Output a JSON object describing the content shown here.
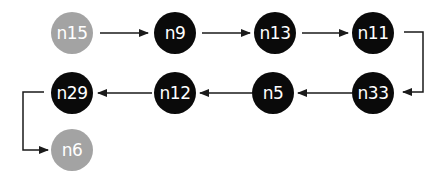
{
  "diagram": {
    "nodes": [
      {
        "id": "n15",
        "label": "n15",
        "style": "grey",
        "x": 72,
        "y": 33
      },
      {
        "id": "n9",
        "label": "n9",
        "style": "dark",
        "x": 175,
        "y": 33
      },
      {
        "id": "n13",
        "label": "n13",
        "style": "dark",
        "x": 275,
        "y": 33
      },
      {
        "id": "n11",
        "label": "n11",
        "style": "dark",
        "x": 373,
        "y": 33
      },
      {
        "id": "n33",
        "label": "n33",
        "style": "dark",
        "x": 373,
        "y": 93
      },
      {
        "id": "n5",
        "label": "n5",
        "style": "dark",
        "x": 273,
        "y": 93
      },
      {
        "id": "n12",
        "label": "n12",
        "style": "dark",
        "x": 175,
        "y": 93
      },
      {
        "id": "n29",
        "label": "n29",
        "style": "dark",
        "x": 72,
        "y": 93
      },
      {
        "id": "n6",
        "label": "n6",
        "style": "grey",
        "x": 72,
        "y": 150
      }
    ],
    "edges": [
      {
        "from": "n15",
        "to": "n9"
      },
      {
        "from": "n9",
        "to": "n13"
      },
      {
        "from": "n13",
        "to": "n11"
      },
      {
        "from": "n11",
        "to": "n33"
      },
      {
        "from": "n33",
        "to": "n5"
      },
      {
        "from": "n5",
        "to": "n12"
      },
      {
        "from": "n12",
        "to": "n29"
      },
      {
        "from": "n29",
        "to": "n6"
      }
    ],
    "colors": {
      "dark": "#0a0a0a",
      "grey": "#a3a3a3",
      "edge": "#1a1a1a"
    }
  }
}
